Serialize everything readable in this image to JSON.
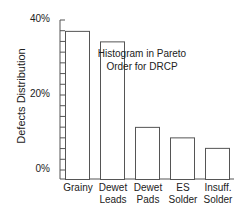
{
  "chart_data": {
    "type": "bar",
    "title": "Histogram in Pareto Order for DRCP",
    "title_lines": [
      "Histogram in Pareto",
      "Order for DRCP"
    ],
    "xlabel": "",
    "ylabel": "Defects Distribution",
    "categories": [
      "Grainy",
      "Dewet Leads",
      "Dewet Pads",
      "ES Solder",
      "Insuff. Solder"
    ],
    "category_lines": [
      [
        "Grainy"
      ],
      [
        "Dewet",
        "Leads"
      ],
      [
        "Dewet",
        "Pads"
      ],
      [
        "ES",
        "Solder"
      ],
      [
        "Insuff.",
        "Solder"
      ]
    ],
    "values": [
      37.1,
      34.3,
      11.5,
      8.7,
      5.9
    ],
    "unit": "%",
    "ylim": [
      0,
      40
    ],
    "yticks": [
      "0%",
      "20%",
      "40%"
    ],
    "minor_tick_step": 2.857,
    "grid": false,
    "legend": null,
    "colors": {
      "bar_fill": "#ffffff",
      "bar_stroke": "#555555",
      "axis": "#555555"
    }
  }
}
